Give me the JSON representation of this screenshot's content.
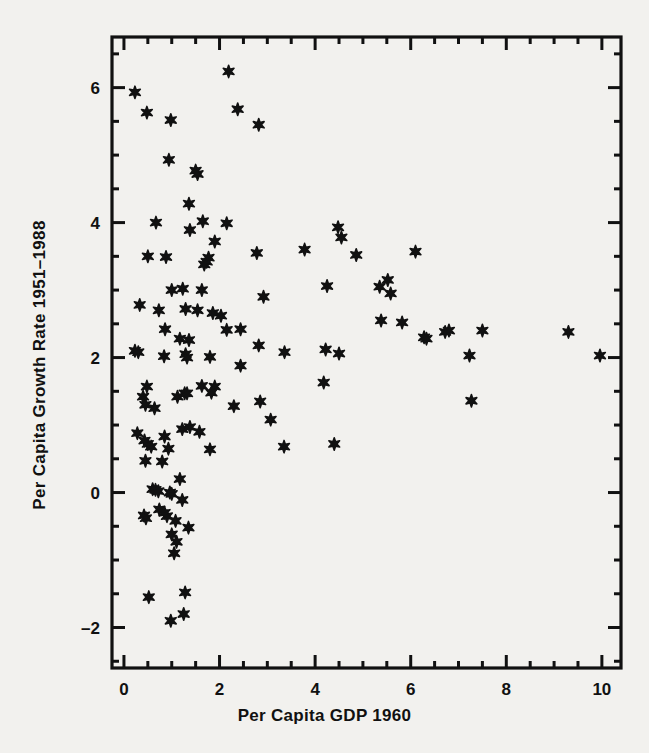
{
  "figure": {
    "background_color": "#f2f1ee",
    "ink_color": "#111111"
  },
  "axis": {
    "x_title": "Per Capita GDP 1960",
    "y_title": "Per Capita Growth Rate 1951–1988",
    "x_tick_labels": [
      "0",
      "2",
      "4",
      "6",
      "8",
      "10"
    ],
    "y_tick_labels": [
      "6",
      "4",
      "2",
      "0",
      "–2"
    ]
  },
  "chart_data": {
    "type": "scatter",
    "title": "",
    "xlabel": "Per Capita GDP 1960",
    "ylabel": "Per Capita Growth Rate 1951-1988",
    "xlim": [
      -0.25,
      10.4
    ],
    "ylim": [
      -2.6,
      6.75
    ],
    "xticks": [
      0,
      2,
      4,
      6,
      8,
      10
    ],
    "yticks": [
      -2,
      0,
      2,
      4,
      6
    ],
    "x_minor_tick_step": 0.5,
    "y_minor_tick_step": 0.5,
    "grid": false,
    "legend": null,
    "marker": "six-pointed-star",
    "marker_color": "#111111",
    "n_points": 118,
    "points": [
      [
        2.19,
        6.24
      ],
      [
        0.23,
        5.93
      ],
      [
        2.38,
        5.68
      ],
      [
        0.48,
        5.63
      ],
      [
        0.98,
        5.52
      ],
      [
        2.82,
        5.45
      ],
      [
        0.94,
        4.93
      ],
      [
        1.5,
        4.77
      ],
      [
        1.54,
        4.72
      ],
      [
        1.36,
        4.28
      ],
      [
        0.67,
        4.0
      ],
      [
        1.65,
        4.02
      ],
      [
        2.15,
        3.99
      ],
      [
        1.38,
        3.89
      ],
      [
        4.48,
        3.93
      ],
      [
        1.9,
        3.72
      ],
      [
        4.55,
        3.78
      ],
      [
        1.77,
        3.48
      ],
      [
        0.5,
        3.5
      ],
      [
        0.88,
        3.49
      ],
      [
        1.73,
        3.42
      ],
      [
        1.68,
        3.38
      ],
      [
        2.78,
        3.55
      ],
      [
        3.78,
        3.6
      ],
      [
        4.86,
        3.52
      ],
      [
        6.1,
        3.57
      ],
      [
        5.52,
        3.15
      ],
      [
        5.35,
        3.05
      ],
      [
        4.25,
        3.06
      ],
      [
        5.58,
        2.95
      ],
      [
        1.0,
        3.0
      ],
      [
        1.23,
        3.02
      ],
      [
        1.63,
        3.0
      ],
      [
        2.92,
        2.9
      ],
      [
        0.33,
        2.78
      ],
      [
        0.73,
        2.7
      ],
      [
        1.29,
        2.72
      ],
      [
        1.54,
        2.7
      ],
      [
        1.86,
        2.66
      ],
      [
        2.03,
        2.62
      ],
      [
        6.28,
        2.3
      ],
      [
        6.33,
        2.28
      ],
      [
        6.72,
        2.38
      ],
      [
        6.8,
        2.4
      ],
      [
        5.38,
        2.55
      ],
      [
        5.82,
        2.52
      ],
      [
        7.5,
        2.4
      ],
      [
        9.3,
        2.38
      ],
      [
        0.86,
        2.42
      ],
      [
        2.15,
        2.41
      ],
      [
        1.17,
        2.28
      ],
      [
        1.36,
        2.26
      ],
      [
        2.44,
        2.42
      ],
      [
        2.82,
        2.18
      ],
      [
        0.23,
        2.1
      ],
      [
        0.3,
        2.08
      ],
      [
        0.84,
        2.02
      ],
      [
        1.29,
        2.05
      ],
      [
        1.32,
        2.0
      ],
      [
        1.8,
        2.01
      ],
      [
        3.36,
        2.08
      ],
      [
        4.5,
        2.06
      ],
      [
        4.22,
        2.12
      ],
      [
        7.23,
        2.03
      ],
      [
        9.96,
        2.03
      ],
      [
        2.44,
        1.88
      ],
      [
        1.63,
        1.58
      ],
      [
        0.48,
        1.57
      ],
      [
        1.9,
        1.57
      ],
      [
        4.18,
        1.63
      ],
      [
        1.83,
        1.48
      ],
      [
        1.12,
        1.42
      ],
      [
        1.27,
        1.47
      ],
      [
        1.32,
        1.47
      ],
      [
        0.4,
        1.42
      ],
      [
        0.45,
        1.3
      ],
      [
        0.64,
        1.25
      ],
      [
        2.3,
        1.28
      ],
      [
        2.85,
        1.35
      ],
      [
        7.27,
        1.36
      ],
      [
        1.22,
        0.94
      ],
      [
        1.38,
        0.97
      ],
      [
        3.07,
        1.08
      ],
      [
        1.58,
        0.9
      ],
      [
        0.28,
        0.88
      ],
      [
        0.85,
        0.83
      ],
      [
        0.43,
        0.77
      ],
      [
        0.5,
        0.72
      ],
      [
        0.57,
        0.68
      ],
      [
        0.93,
        0.65
      ],
      [
        1.8,
        0.64
      ],
      [
        3.35,
        0.68
      ],
      [
        4.4,
        0.72
      ],
      [
        0.45,
        0.47
      ],
      [
        0.8,
        0.46
      ],
      [
        1.17,
        0.2
      ],
      [
        0.6,
        0.05
      ],
      [
        0.66,
        0.04
      ],
      [
        0.72,
        0.02
      ],
      [
        0.96,
        0.0
      ],
      [
        1.0,
        -0.02
      ],
      [
        1.22,
        -0.11
      ],
      [
        0.42,
        -0.34
      ],
      [
        0.46,
        -0.38
      ],
      [
        0.74,
        -0.25
      ],
      [
        0.85,
        -0.3
      ],
      [
        0.9,
        -0.35
      ],
      [
        1.08,
        -0.42
      ],
      [
        1.35,
        -0.52
      ],
      [
        1.0,
        -0.62
      ],
      [
        1.1,
        -0.73
      ],
      [
        1.05,
        -0.9
      ],
      [
        0.52,
        -1.55
      ],
      [
        1.28,
        -1.48
      ],
      [
        0.98,
        -1.9
      ],
      [
        1.25,
        -1.8
      ]
    ]
  }
}
